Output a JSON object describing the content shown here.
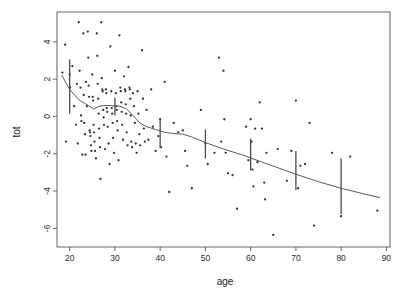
{
  "chart_data": {
    "type": "scatter",
    "title": "",
    "xlabel": "age",
    "ylabel": "tot",
    "xlim": [
      17.2,
      90.8
    ],
    "ylim": [
      -7.0,
      5.6
    ],
    "grid": false,
    "legend": null,
    "x_ticks": [
      20,
      30,
      40,
      50,
      60,
      70,
      80,
      90
    ],
    "y_ticks": [
      4,
      2,
      0,
      -2,
      -4,
      -6
    ],
    "x_tick_labels": [
      "20",
      "30",
      "40",
      "50",
      "60",
      "70",
      "80",
      "90"
    ],
    "y_tick_labels": [
      "4",
      "2",
      "0",
      "-2",
      "-4",
      "-6"
    ],
    "point_color": "#333333",
    "line_color": "#5a5a5a",
    "errorbar_color": "#4a4a4a",
    "axis_color": "#555555",
    "points": [
      [
        18.4,
        2.35
      ],
      [
        19.0,
        3.85
      ],
      [
        19.2,
        -1.35
      ],
      [
        20.0,
        2.25
      ],
      [
        20.1,
        1.55
      ],
      [
        20.6,
        2.7
      ],
      [
        21.0,
        0.55
      ],
      [
        21.4,
        -0.45
      ],
      [
        21.6,
        1.75
      ],
      [
        21.8,
        -1.45
      ],
      [
        22.0,
        5.05
      ],
      [
        22.2,
        2.45
      ],
      [
        22.4,
        1.55
      ],
      [
        22.5,
        0.05
      ],
      [
        22.6,
        -0.25
      ],
      [
        22.8,
        -2.05
      ],
      [
        23.0,
        4.45
      ],
      [
        23.1,
        1.15
      ],
      [
        23.2,
        -0.35
      ],
      [
        23.4,
        -0.95
      ],
      [
        23.5,
        -2.05
      ],
      [
        23.6,
        1.85
      ],
      [
        23.8,
        0.55
      ],
      [
        24.0,
        4.55
      ],
      [
        24.1,
        3.15
      ],
      [
        24.2,
        1.65
      ],
      [
        24.3,
        1.05
      ],
      [
        24.4,
        -0.75
      ],
      [
        24.5,
        -0.85
      ],
      [
        24.6,
        -1.05
      ],
      [
        24.7,
        -1.55
      ],
      [
        24.8,
        -1.85
      ],
      [
        25.0,
        2.25
      ],
      [
        25.1,
        1.05
      ],
      [
        25.2,
        0.85
      ],
      [
        25.3,
        -0.45
      ],
      [
        25.4,
        -0.85
      ],
      [
        25.5,
        -1.35
      ],
      [
        25.6,
        -1.85
      ],
      [
        25.8,
        -2.25
      ],
      [
        26.0,
        4.45
      ],
      [
        26.1,
        3.25
      ],
      [
        26.2,
        1.75
      ],
      [
        26.3,
        0.95
      ],
      [
        26.4,
        0.15
      ],
      [
        26.5,
        -0.65
      ],
      [
        26.6,
        -1.15
      ],
      [
        26.7,
        -1.65
      ],
      [
        26.8,
        -3.35
      ],
      [
        27.0,
        5.05
      ],
      [
        27.1,
        2.05
      ],
      [
        27.2,
        1.45
      ],
      [
        27.3,
        1.35
      ],
      [
        27.4,
        0.35
      ],
      [
        27.5,
        -0.05
      ],
      [
        27.6,
        -0.45
      ],
      [
        27.8,
        -1.75
      ],
      [
        28.0,
        1.45
      ],
      [
        28.1,
        1.25
      ],
      [
        28.2,
        0.45
      ],
      [
        28.3,
        0.25
      ],
      [
        28.4,
        -0.55
      ],
      [
        28.6,
        -1.45
      ],
      [
        28.8,
        -2.55
      ],
      [
        29.0,
        3.75
      ],
      [
        29.2,
        1.35
      ],
      [
        29.3,
        0.45
      ],
      [
        29.4,
        0.15
      ],
      [
        29.5,
        -0.35
      ],
      [
        29.6,
        -1.15
      ],
      [
        29.8,
        -1.95
      ],
      [
        30.0,
        2.45
      ],
      [
        30.2,
        1.25
      ],
      [
        30.3,
        0.55
      ],
      [
        30.4,
        0.35
      ],
      [
        30.5,
        -0.25
      ],
      [
        30.6,
        -0.75
      ],
      [
        30.8,
        -2.35
      ],
      [
        31.0,
        4.35
      ],
      [
        31.2,
        1.55
      ],
      [
        31.3,
        1.35
      ],
      [
        31.4,
        0.75
      ],
      [
        31.5,
        0.25
      ],
      [
        31.6,
        -0.45
      ],
      [
        31.8,
        -1.25
      ],
      [
        32.0,
        2.15
      ],
      [
        32.2,
        1.45
      ],
      [
        32.3,
        1.35
      ],
      [
        32.4,
        0.65
      ],
      [
        32.5,
        0.15
      ],
      [
        32.6,
        -0.85
      ],
      [
        32.8,
        -1.55
      ],
      [
        33.0,
        2.65
      ],
      [
        33.2,
        1.55
      ],
      [
        33.3,
        1.45
      ],
      [
        33.4,
        0.95
      ],
      [
        33.5,
        0.05
      ],
      [
        33.6,
        -1.35
      ],
      [
        33.8,
        -1.65
      ],
      [
        34.0,
        1.25
      ],
      [
        34.2,
        0.55
      ],
      [
        34.4,
        -0.35
      ],
      [
        34.6,
        -1.45
      ],
      [
        34.8,
        -1.95
      ],
      [
        35.0,
        1.35
      ],
      [
        35.2,
        0.15
      ],
      [
        35.4,
        -0.95
      ],
      [
        35.6,
        -1.55
      ],
      [
        36.0,
        3.55
      ],
      [
        36.2,
        0.95
      ],
      [
        36.4,
        -0.65
      ],
      [
        36.6,
        -1.35
      ],
      [
        37.0,
        0.35
      ],
      [
        37.4,
        -1.25
      ],
      [
        38.0,
        1.45
      ],
      [
        38.4,
        -0.55
      ],
      [
        39.0,
        -1.85
      ],
      [
        39.6,
        -1.05
      ],
      [
        40.0,
        -0.15
      ],
      [
        40.2,
        -1.65
      ],
      [
        41.0,
        1.85
      ],
      [
        41.4,
        -2.15
      ],
      [
        42.0,
        -4.05
      ],
      [
        43.0,
        -0.35
      ],
      [
        44.0,
        -0.85
      ],
      [
        45.0,
        -0.75
      ],
      [
        45.5,
        -1.85
      ],
      [
        46.0,
        -2.65
      ],
      [
        47.0,
        -3.85
      ],
      [
        49.0,
        0.35
      ],
      [
        50.0,
        -1.45
      ],
      [
        50.5,
        -2.55
      ],
      [
        52.0,
        -1.95
      ],
      [
        53.0,
        3.15
      ],
      [
        53.5,
        -1.35
      ],
      [
        54.0,
        2.45
      ],
      [
        54.2,
        -0.15
      ],
      [
        54.5,
        -1.95
      ],
      [
        55.0,
        -3.05
      ],
      [
        56.0,
        -3.15
      ],
      [
        57.0,
        -4.95
      ],
      [
        59.0,
        -0.55
      ],
      [
        59.5,
        -2.35
      ],
      [
        60.0,
        -0.15
      ],
      [
        60.2,
        -1.35
      ],
      [
        60.4,
        -2.85
      ],
      [
        60.6,
        -3.75
      ],
      [
        61.0,
        -0.65
      ],
      [
        61.5,
        -2.45
      ],
      [
        62.0,
        0.75
      ],
      [
        62.5,
        -0.65
      ],
      [
        63.0,
        -3.55
      ],
      [
        63.2,
        -4.45
      ],
      [
        63.5,
        -1.95
      ],
      [
        65.0,
        -6.35
      ],
      [
        66.0,
        -1.75
      ],
      [
        68.0,
        -3.45
      ],
      [
        69.0,
        -1.85
      ],
      [
        70.0,
        0.85
      ],
      [
        70.5,
        -3.85
      ],
      [
        71.0,
        -2.65
      ],
      [
        72.0,
        -2.55
      ],
      [
        73.0,
        -0.35
      ],
      [
        74.0,
        -5.85
      ],
      [
        78.0,
        -1.95
      ],
      [
        80.0,
        -5.35
      ],
      [
        82.0,
        -2.15
      ],
      [
        88.0,
        -5.05
      ]
    ],
    "smooth_line": [
      [
        18.3,
        2.2
      ],
      [
        20.0,
        1.45
      ],
      [
        22.0,
        0.9
      ],
      [
        24.0,
        0.6
      ],
      [
        25.3,
        0.4
      ],
      [
        26.5,
        0.55
      ],
      [
        27.5,
        0.58
      ],
      [
        29.0,
        0.58
      ],
      [
        31.0,
        0.55
      ],
      [
        32.5,
        0.42
      ],
      [
        34.0,
        0.05
      ],
      [
        35.5,
        -0.35
      ],
      [
        37.0,
        -0.55
      ],
      [
        39.0,
        -0.7
      ],
      [
        41.0,
        -0.85
      ],
      [
        43.0,
        -0.92
      ],
      [
        45.0,
        -0.95
      ],
      [
        47.0,
        -1.1
      ],
      [
        50.0,
        -1.4
      ],
      [
        54.0,
        -1.75
      ],
      [
        58.0,
        -2.05
      ],
      [
        62.0,
        -2.4
      ],
      [
        66.0,
        -2.75
      ],
      [
        70.0,
        -3.1
      ],
      [
        75.0,
        -3.5
      ],
      [
        80.0,
        -3.85
      ],
      [
        85.0,
        -4.15
      ],
      [
        88.5,
        -4.35
      ]
    ],
    "error_bars": [
      {
        "x": 20,
        "center": 1.6,
        "lower": 0.15,
        "upper": 3.05
      },
      {
        "x": 30,
        "center": 0.55,
        "lower": 0.05,
        "upper": 1.0
      },
      {
        "x": 40,
        "center": -0.85,
        "lower": -1.7,
        "upper": -0.15
      },
      {
        "x": 50,
        "center": -1.45,
        "lower": -2.25,
        "upper": -0.7
      },
      {
        "x": 60,
        "center": -2.0,
        "lower": -2.9,
        "upper": -1.2
      },
      {
        "x": 70,
        "center": -2.85,
        "lower": -3.95,
        "upper": -1.85
      },
      {
        "x": 80,
        "center": -3.8,
        "lower": -5.25,
        "upper": -2.25
      }
    ]
  }
}
